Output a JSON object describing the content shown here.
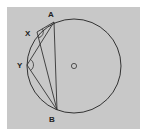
{
  "diagram": {
    "type": "circle-geometry",
    "background_color": "#c8c8c8",
    "line_color": "#333333",
    "circle": {
      "center_label": "O",
      "cx": 74,
      "cy": 66,
      "r": 47
    },
    "points": {
      "A": {
        "label": "A",
        "x": 54,
        "y": 22
      },
      "X": {
        "label": "X",
        "x": 37,
        "y": 32
      },
      "Y": {
        "label": "Y",
        "x": 27,
        "y": 65
      },
      "B": {
        "label": "B",
        "x": 57,
        "y": 110
      }
    },
    "segments": [
      [
        "A",
        "B"
      ],
      [
        "A",
        "X"
      ],
      [
        "X",
        "B"
      ],
      [
        "A",
        "Y"
      ],
      [
        "Y",
        "B"
      ]
    ],
    "angle_marks": [
      "AXB",
      "AYB"
    ]
  }
}
